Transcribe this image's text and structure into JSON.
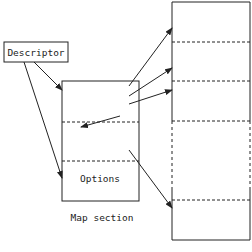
{
  "diagram": {
    "descriptor_label": "Descriptor",
    "options_label": "Options",
    "map_section_label": "Map section",
    "colors": {
      "stroke": "#222222",
      "background": "#ffffff"
    }
  }
}
